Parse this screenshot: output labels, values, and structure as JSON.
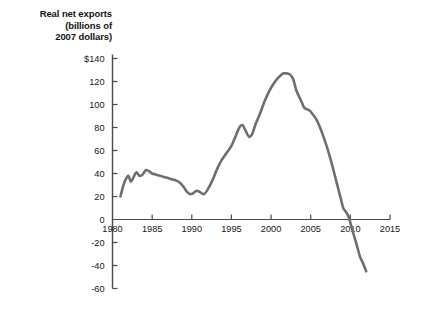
{
  "chart_data": {
    "type": "line",
    "title": "Real net exports (billions of 2007 dollars)",
    "title_lines": [
      "Real net exports",
      "(billions of",
      "2007 dollars)"
    ],
    "xlabel": "",
    "ylabel": "Real net exports (billions of 2007 dollars)",
    "xlim": [
      1980,
      2015
    ],
    "ylim": [
      -60,
      140
    ],
    "grid": false,
    "legend": false,
    "line_color": "#6e6e6e",
    "axis_color": "#4a4a4a",
    "text_color": "#141414",
    "background_color": "#ffffff",
    "x_ticks": [
      1980,
      1985,
      1990,
      1995,
      2000,
      2005,
      2010,
      2015
    ],
    "x_tick_labels": [
      "1980",
      "1985",
      "1990",
      "1995",
      "2000",
      "2005",
      "2010",
      "2015"
    ],
    "y_ticks": [
      140,
      120,
      100,
      80,
      60,
      40,
      20,
      0,
      -20,
      -40,
      -60
    ],
    "y_tick_labels": [
      "$140",
      "120",
      "100",
      "80",
      "60",
      "40",
      "20",
      "0",
      "-20",
      "-40",
      "-60"
    ],
    "series": [
      {
        "name": "Real net exports",
        "x": [
          1981.0,
          1981.3,
          1981.6,
          1982.0,
          1982.3,
          1982.6,
          1983.0,
          1983.4,
          1983.8,
          1984.2,
          1984.6,
          1985.0,
          1985.5,
          1986.0,
          1986.5,
          1987.0,
          1987.5,
          1988.0,
          1988.5,
          1989.0,
          1989.4,
          1989.8,
          1990.2,
          1990.6,
          1991.0,
          1991.5,
          1992.0,
          1992.6,
          1993.2,
          1993.8,
          1994.4,
          1995.0,
          1995.5,
          1996.0,
          1996.4,
          1996.8,
          1997.2,
          1997.6,
          1998.0,
          1998.6,
          1999.2,
          1999.8,
          2000.4,
          2001.0,
          2001.5,
          2002.0,
          2002.4,
          2002.8,
          2003.2,
          2003.8,
          2004.2,
          2004.8,
          2005.2,
          2005.8,
          2006.4,
          2007.0,
          2007.6,
          2008.2,
          2008.8,
          2009.1,
          2009.4,
          2009.8,
          2010.2,
          2010.8,
          2011.2,
          2011.6,
          2012.0
        ],
        "y": [
          20,
          28,
          34,
          38,
          33,
          36,
          41,
          38,
          39,
          43,
          42,
          40,
          39,
          38,
          37,
          36,
          35,
          34,
          32,
          28,
          24,
          22,
          23,
          25,
          24,
          22,
          26,
          34,
          44,
          52,
          58,
          64,
          72,
          80,
          82,
          77,
          72,
          74,
          82,
          92,
          103,
          112,
          119,
          124,
          127,
          127,
          126,
          122,
          112,
          103,
          97,
          95,
          92,
          86,
          76,
          64,
          50,
          34,
          18,
          10,
          7,
          2,
          -8,
          -22,
          -32,
          -38,
          -45
        ]
      }
    ],
    "annotations": {
      "peak_value": 127,
      "peak_year": 2001.5,
      "trough_value": -45,
      "trough_year": 2012,
      "zero_crossing_year": 2009.9
    }
  }
}
